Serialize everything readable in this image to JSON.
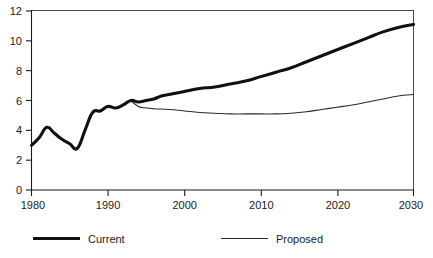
{
  "chart_data": {
    "type": "line",
    "title": "",
    "subtitle": "",
    "xlabel": "",
    "ylabel": "",
    "xlim": [
      1980,
      2030
    ],
    "ylim": [
      0,
      12
    ],
    "grid": false,
    "legend_position": "bottom",
    "x_ticks": [
      1980,
      1990,
      2000,
      2010,
      2020,
      2030
    ],
    "x_tick_labels": [
      "1980",
      "1990",
      "2000",
      "2010",
      "2020",
      "2030"
    ],
    "y_ticks": [
      0,
      2,
      4,
      6,
      8,
      10,
      12
    ],
    "y_tick_labels": [
      "0",
      "2",
      "4",
      "6",
      "8",
      "10",
      "12"
    ],
    "series": [
      {
        "name": "Current",
        "style": "thick",
        "color": "#101010",
        "x": [
          1980,
          1981,
          1982,
          1983,
          1984,
          1985,
          1986,
          1987,
          1988,
          1989,
          1990,
          1991,
          1992,
          1993,
          1994,
          1995,
          1996,
          1997,
          1998,
          1999,
          2000,
          2002,
          2004,
          2006,
          2008,
          2010,
          2012,
          2014,
          2016,
          2018,
          2020,
          2022,
          2024,
          2026,
          2028,
          2030
        ],
        "values": [
          3.0,
          3.5,
          4.2,
          3.8,
          3.4,
          3.1,
          2.8,
          4.0,
          5.2,
          5.3,
          5.6,
          5.5,
          5.7,
          6.0,
          5.9,
          6.0,
          6.1,
          6.3,
          6.4,
          6.5,
          6.6,
          6.8,
          6.9,
          7.1,
          7.3,
          7.6,
          7.9,
          8.2,
          8.6,
          9.0,
          9.4,
          9.8,
          10.2,
          10.6,
          10.9,
          11.1
        ]
      },
      {
        "name": "Proposed",
        "style": "thin",
        "color": "#2a2a2a",
        "x": [
          1993,
          1994,
          1995,
          1996,
          1998,
          2000,
          2002,
          2004,
          2006,
          2008,
          2010,
          2012,
          2014,
          2016,
          2018,
          2020,
          2022,
          2024,
          2026,
          2028,
          2030
        ],
        "values": [
          6.0,
          5.6,
          5.5,
          5.45,
          5.4,
          5.3,
          5.2,
          5.15,
          5.1,
          5.1,
          5.1,
          5.1,
          5.15,
          5.25,
          5.4,
          5.55,
          5.7,
          5.9,
          6.1,
          6.3,
          6.4
        ]
      }
    ],
    "legend_entries": [
      {
        "label": "Current",
        "style": "thick"
      },
      {
        "label": "Proposed",
        "style": "thin"
      }
    ]
  },
  "legend": {
    "current_label": "Current",
    "proposed_label": "Proposed"
  }
}
